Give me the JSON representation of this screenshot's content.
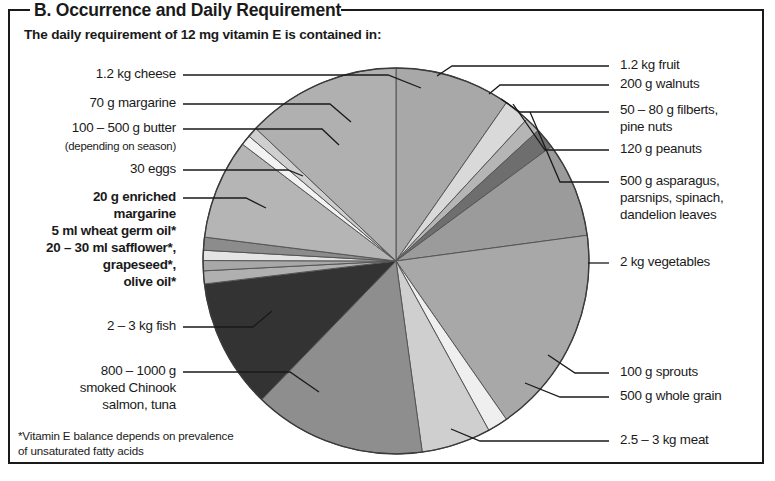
{
  "panel": {
    "section_title": "B. Occurrence and Daily Requirement",
    "subtitle": "The daily requirement of 12 mg vitamin E is contained in:",
    "footnote_line1": "*Vitamin E balance depends on prevalence",
    "footnote_line2": "of unsaturated fatty acids"
  },
  "labels": {
    "cheese": "1.2 kg cheese",
    "margarine70": "70 g margarine",
    "butter": "100 – 500 g butter",
    "butter_note": "(depending on season)",
    "eggs": "30 eggs",
    "enriched_margarine_l1": "20 g enriched",
    "enriched_margarine_l2": "margarine",
    "wheat_germ_oil": "5 ml wheat germ oil*",
    "safflower_l1": "20 – 30 ml safflower*,",
    "safflower_l2": "grapeseed*,",
    "safflower_l3": "olive oil*",
    "fish": "2 – 3 kg fish",
    "salmon_l1": "800 – 1000 g",
    "salmon_l2": "smoked Chinook",
    "salmon_l3": "salmon, tuna",
    "fruit": "1.2 kg fruit",
    "walnuts": "200 g walnuts",
    "filberts_l1": "50 – 80 g filberts,",
    "filberts_l2": "pine nuts",
    "peanuts": "120 g peanuts",
    "asparagus_l1": "500 g asparagus,",
    "asparagus_l2": "parsnips, spinach,",
    "asparagus_l3": "dandelion leaves",
    "vegetables": "2 kg vegetables",
    "sprouts": "100 g sprouts",
    "whole_grain": "500 g whole grain",
    "meat": "2.5 – 3 kg meat"
  },
  "chart_data": {
    "type": "pie",
    "title": "The daily requirement of 12 mg vitamin E is contained in:",
    "center": [
      396,
      261
    ],
    "radius": 193,
    "start_angle_deg": -90,
    "legend": "leader-lines",
    "grid": false,
    "categories": [
      "1.2 kg fruit",
      "200 g walnuts",
      "50 – 80 g filberts, pine nuts",
      "120 g peanuts",
      "500 g asparagus, parsnips, spinach, dandelion leaves",
      "2 kg vegetables",
      "100 g sprouts",
      "500 g whole grain",
      "2.5 – 3 kg meat",
      "800 – 1000 g smoked Chinook salmon, tuna",
      "2 – 3 kg fish",
      "20 – 30 ml safflower*, grapeseed*, olive oil*",
      "5 ml wheat germ oil*",
      "20 g enriched margarine",
      "30 eggs",
      "100 – 500 g butter",
      "70 g margarine",
      "1.2 kg cheese"
    ],
    "values": [
      12.5,
      2.8,
      1.7,
      2.2,
      10.3,
      22.5,
      2.2,
      7.5,
      18.6,
      14.0,
      1.4,
      1.1,
      1.1,
      1.4,
      10.8,
      1.1,
      1.1,
      16.7
    ],
    "colors": [
      "#a8a8a8",
      "#d9d9d9",
      "#b5b5b5",
      "#6e6e6e",
      "#9b9b9b",
      "#a8a8a8",
      "#efefef",
      "#cfcfcf",
      "#8e8e8e",
      "#333333",
      "#b0b0b0",
      "#a8a8a8",
      "#e4e4e4",
      "#8c8c8c",
      "#b5b5b5",
      "#f2f2f2",
      "#cfcfcf",
      "#b0b0b0"
    ],
    "stroke": "#555555",
    "units": "degrees of circle"
  }
}
